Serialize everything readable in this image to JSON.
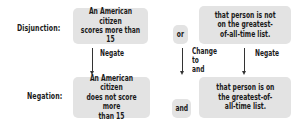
{
  "disjunction": {
    "label": "Disjunction:",
    "left": "An American citizen\nscores more than 15",
    "connective": "or",
    "right": "that person is not\non the greatest-\nof-all-time list."
  },
  "negation": {
    "label": "Negation:",
    "left": "An American citizen\ndoes not score more\nthan 15",
    "connective": "and",
    "right": "that person is on\nthe greatest-of-\nall-time list."
  },
  "arrows": {
    "left": "Negate",
    "middle": "Change\nto\nand",
    "right": "Negate"
  },
  "colors": {
    "box_fill": "#e3e3e3",
    "text": "#1a1a1a",
    "arrow": "#333333"
  }
}
